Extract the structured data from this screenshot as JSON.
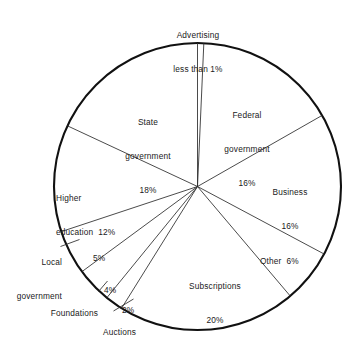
{
  "chart_data": {
    "type": "pie",
    "title": "",
    "subtitle": "",
    "xlabel": "",
    "ylabel": "",
    "legend_position": "none",
    "grid": false,
    "units": "percent",
    "start_angle_deg": 0,
    "direction": "clockwise",
    "total": 100,
    "categories": [
      "Advertising",
      "Federal government",
      "Business",
      "Other",
      "Subscriptions",
      "Auctions",
      "Foundations",
      "Local government",
      "Higher education",
      "State government"
    ],
    "values": [
      0.7,
      16,
      16,
      6,
      20,
      2,
      4,
      5,
      12,
      18
    ],
    "value_labels": [
      "less than 1%",
      "16%",
      "16%",
      "6%",
      "20%",
      "2%",
      "4%",
      "5%",
      "12%",
      "18%"
    ],
    "slices": [
      {
        "name": "Advertising",
        "value": 0.7,
        "label": "Advertising",
        "value_label": "less than 1%"
      },
      {
        "name": "Federal government",
        "value": 16,
        "label": "Federal government",
        "value_label": "16%"
      },
      {
        "name": "Business",
        "value": 16,
        "label": "Business",
        "value_label": "16%"
      },
      {
        "name": "Other",
        "value": 6,
        "label": "Other",
        "value_label": "6%"
      },
      {
        "name": "Subscriptions",
        "value": 20,
        "label": "Subscriptions",
        "value_label": "20%"
      },
      {
        "name": "Auctions",
        "value": 2,
        "label": "Auctions",
        "value_label": "2%"
      },
      {
        "name": "Foundations",
        "value": 4,
        "label": "Foundations",
        "value_label": "4%"
      },
      {
        "name": "Local government",
        "value": 5,
        "label": "Local government",
        "value_label": "5%"
      },
      {
        "name": "Higher education",
        "value": 12,
        "label": "Higher education",
        "value_label": "12%"
      },
      {
        "name": "State government",
        "value": 18,
        "label": "State government",
        "value_label": "18%"
      }
    ],
    "geometry": {
      "center_x": 197.5,
      "center_y": 186.5,
      "radius": 143.5
    },
    "colors": {
      "outline": "#111111",
      "divider": "#2b2b2b",
      "text": "#1a1a1a",
      "background": "#ffffff"
    }
  },
  "labels": {
    "advertising_line1": "Advertising",
    "advertising_line2": "less than 1%",
    "federal_line1": "Federal",
    "federal_line2": "government",
    "federal_line3": "16%",
    "business_line1": "Business",
    "business_line2": "16%",
    "other": "Other  6%",
    "subscriptions_line1": "Subscriptions",
    "subscriptions_line2": "20%",
    "auctions": "Auctions",
    "auctions_pct": "2%",
    "foundations": "Foundations",
    "foundations_pct": "4%",
    "local_line1": "Local",
    "local_line2": "government",
    "local_pct": "5%",
    "higher_line1": "Higher",
    "higher_line2": "education  12%",
    "state_line1": "State",
    "state_line2": "government",
    "state_line3": "18%"
  }
}
